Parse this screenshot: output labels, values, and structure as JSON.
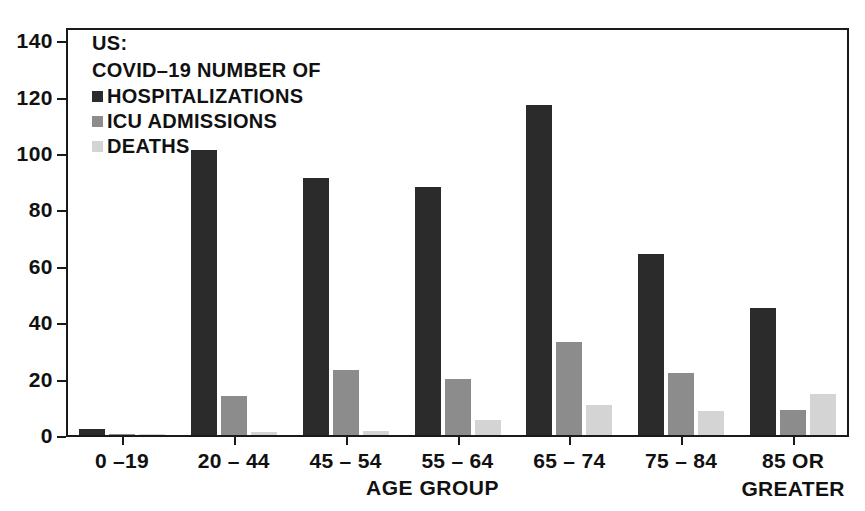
{
  "chart_data": {
    "type": "bar",
    "title": "",
    "legend_heading": [
      "US:",
      "COVID–19 NUMBER OF"
    ],
    "categories": [
      "0 –19",
      "20 – 44",
      "45 – 54",
      "55 – 64",
      "65 – 74",
      "75 – 84",
      "85 OR\nGREATER"
    ],
    "series": [
      {
        "name": "HOSPITALIZATIONS",
        "color": "#2b2b2b",
        "values": [
          2,
          101,
          91,
          88,
          117,
          64,
          45
        ]
      },
      {
        "name": "ICU ADMISSIONS",
        "color": "#8c8c8c",
        "values": [
          0.4,
          14,
          23,
          20,
          33,
          22,
          9
        ]
      },
      {
        "name": "DEATHS",
        "color": "#d4d4d4",
        "values": [
          0.3,
          1,
          1.5,
          5.5,
          10.5,
          8.5,
          14.5
        ]
      }
    ],
    "xlabel": "AGE GROUP",
    "ylabel": "",
    "ylim": [
      0,
      145
    ],
    "yticks": [
      0,
      20,
      40,
      60,
      80,
      100,
      120,
      140
    ],
    "grid": false,
    "legend_position": "top-left-inside",
    "frame_color": "#1a1a1a"
  }
}
